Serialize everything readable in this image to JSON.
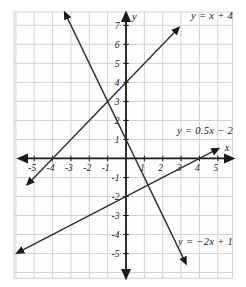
{
  "figure": {
    "background": "#ffffff",
    "plot_background": "#fefefe",
    "grid_color": "#d2d2d2",
    "axis_color": "#1a1a1a",
    "line_color": "#2e2e2e",
    "tick_label_color": "#222222"
  },
  "chart_data": {
    "type": "line",
    "title": "",
    "xlabel": "x",
    "ylabel": "y",
    "xlim": [
      -6.1,
      5.8
    ],
    "ylim": [
      -6.3,
      7.7
    ],
    "grid": true,
    "x_ticks": [
      -5,
      -4,
      -3,
      -2,
      -1,
      1,
      2,
      3,
      4,
      5
    ],
    "y_ticks": [
      -5,
      -4,
      -3,
      -2,
      -1,
      1,
      2,
      3,
      4,
      5,
      6,
      7
    ],
    "series": [
      {
        "name": "y = x + 4",
        "equation": "y = x + 4",
        "slope": 1,
        "intercept": 4,
        "x_start": -5.35,
        "x_end": 2.85,
        "x_intercept": -4,
        "y_intercept": 4
      },
      {
        "name": "y = 0.5x − 2",
        "equation": "y = 0.5x - 2",
        "slope": 0.5,
        "intercept": -2,
        "x_start": -5.9,
        "x_end": 5.0,
        "x_intercept": 4,
        "y_intercept": -2
      },
      {
        "name": "y = −2x + 1",
        "equation": "y = -2x + 1",
        "slope": -2,
        "intercept": 1,
        "x_start": -3.32,
        "x_end": 3.25,
        "x_intercept": 0.5,
        "y_intercept": 1
      }
    ]
  }
}
